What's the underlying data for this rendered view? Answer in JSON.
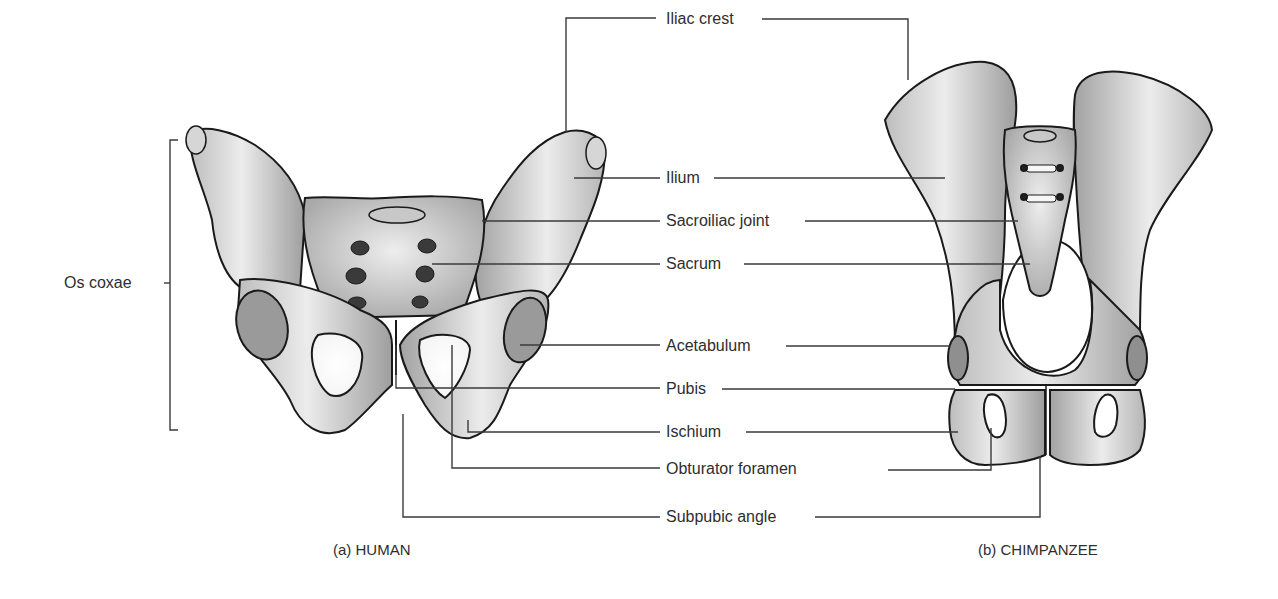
{
  "figure": {
    "panels": [
      {
        "id": "a",
        "caption": "(a) HUMAN"
      },
      {
        "id": "b",
        "caption": "(b) CHIMPANZEE"
      }
    ],
    "bracket_label": "Os coxae",
    "labels": [
      {
        "text": "Iliac crest"
      },
      {
        "text": "Ilium"
      },
      {
        "text": "Sacroiliac joint"
      },
      {
        "text": "Sacrum"
      },
      {
        "text": "Acetabulum"
      },
      {
        "text": "Pubis"
      },
      {
        "text": "Ischium"
      },
      {
        "text": "Obturator foramen"
      },
      {
        "text": "Subpubic angle"
      }
    ],
    "colors": {
      "line": "#3a3a3a",
      "bone_fill": "#e4e4e4",
      "bone_shade": "#a8a8a8",
      "bone_outline": "#1a1a1a",
      "background": "#ffffff"
    }
  }
}
